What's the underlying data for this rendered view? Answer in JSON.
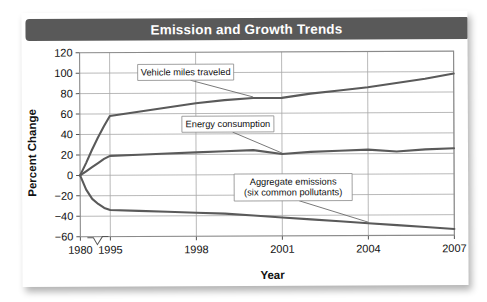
{
  "card": {
    "title": "Emission and Growth Trends"
  },
  "chart_data": {
    "type": "line",
    "title": "Emission and Growth Trends",
    "xlabel": "Year",
    "ylabel": "Percent Change",
    "xlim": [
      1980,
      2007
    ],
    "ylim": [
      -60,
      120
    ],
    "grid": true,
    "legend": "inline-callouts",
    "xtick_labels": [
      "1980",
      "1995",
      "1998",
      "2001",
      "2004",
      "2007"
    ],
    "xtick_values": [
      1980,
      1995,
      1998,
      2001,
      2004,
      2007
    ],
    "ytick_labels": [
      "120",
      "100",
      "80",
      "60",
      "40",
      "20",
      "0",
      "-20",
      "-40",
      "-60"
    ],
    "ytick_values": [
      120,
      100,
      80,
      60,
      40,
      20,
      0,
      -20,
      -40,
      -60
    ],
    "axis_break": {
      "axis": "x",
      "between": [
        1980,
        1995
      ],
      "symbol": "zigzag"
    },
    "x": [
      1980,
      1983,
      1986,
      1989,
      1992,
      1995,
      1996,
      1997,
      1998,
      1999,
      2000,
      2001,
      2002,
      2003,
      2004,
      2005,
      2006,
      2007
    ],
    "series": [
      {
        "name": "Vehicle miles traveled",
        "label": "Vehicle miles traveled",
        "values": [
          0,
          12,
          25,
          37,
          48,
          58,
          62,
          66,
          70,
          73,
          75,
          75,
          79,
          82,
          85,
          89,
          93,
          98
        ]
      },
      {
        "name": "Energy consumption",
        "label": "Energy consumption",
        "values": [
          0,
          4,
          8,
          12,
          16,
          19,
          20,
          21,
          22,
          23,
          24,
          20,
          22,
          23,
          24,
          22,
          24,
          25
        ]
      },
      {
        "name": "Aggregate emissions (six common pollutants)",
        "label_line1": "Aggregate emissions",
        "label_line2": "(six common pollutants)",
        "values": [
          0,
          -14,
          -23,
          -28,
          -32,
          -34,
          -35,
          -36,
          -37,
          -38,
          -40,
          -42,
          -44,
          -46,
          -48,
          -50,
          -52,
          -54
        ]
      }
    ]
  }
}
